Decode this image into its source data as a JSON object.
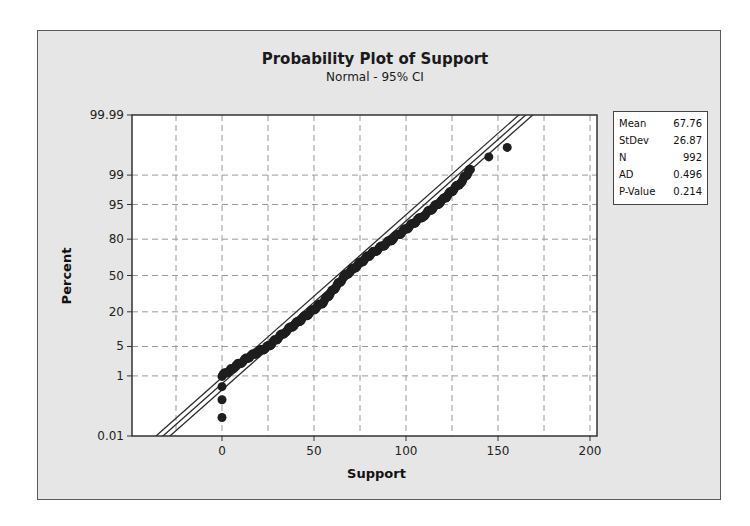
{
  "chart": {
    "title": "Probability Plot of Support",
    "subtitle": "Normal - 95% CI"
  },
  "legend": {
    "rows": [
      {
        "label": "Mean",
        "value": "67.76"
      },
      {
        "label": "StDev",
        "value": "26.87"
      },
      {
        "label": "N",
        "value": "992"
      },
      {
        "label": "AD",
        "value": "0.496"
      },
      {
        "label": "P-Value",
        "value": "0.214"
      }
    ]
  },
  "chart_data": {
    "type": "scatter",
    "title": "Probability Plot of Support",
    "subtitle": "Normal - 95% CI",
    "xlabel": "Support",
    "ylabel": "Percent",
    "xlim": [
      -50,
      205
    ],
    "x_ticks": [
      0,
      50,
      100,
      150,
      200
    ],
    "y_ticks": [
      "0.01",
      "1",
      "5",
      "20",
      "50",
      "80",
      "95",
      "99",
      "99.99"
    ],
    "y_scale": "normal-probability",
    "grid": true,
    "distribution": "Normal",
    "confidence_interval": "95%",
    "stats": {
      "mean": 67.76,
      "stdev": 26.87,
      "n": 992,
      "ad": 0.496,
      "p_value": 0.214
    },
    "fit_line": {
      "description": "Fitted normal line with 95% CI bands",
      "from": {
        "x": -37,
        "percent": 0.01
      },
      "to": {
        "x": 170,
        "percent": 99.99
      }
    },
    "series": [
      {
        "name": "Support",
        "points_approx": [
          {
            "x": 0,
            "percent": 0.05
          },
          {
            "x": 0,
            "percent": 0.2
          },
          {
            "x": 0,
            "percent": 0.5
          },
          {
            "x": 0,
            "percent": 1
          },
          {
            "x": 5,
            "percent": 1.5
          },
          {
            "x": 15,
            "percent": 3
          },
          {
            "x": 25,
            "percent": 5
          },
          {
            "x": 35,
            "percent": 10
          },
          {
            "x": 45,
            "percent": 17
          },
          {
            "x": 55,
            "percent": 27
          },
          {
            "x": 67,
            "percent": 50
          },
          {
            "x": 80,
            "percent": 68
          },
          {
            "x": 95,
            "percent": 82
          },
          {
            "x": 110,
            "percent": 92
          },
          {
            "x": 120,
            "percent": 96
          },
          {
            "x": 130,
            "percent": 98.5
          },
          {
            "x": 135,
            "percent": 99.3
          },
          {
            "x": 145,
            "percent": 99.7
          },
          {
            "x": 155,
            "percent": 99.85
          }
        ]
      }
    ]
  }
}
